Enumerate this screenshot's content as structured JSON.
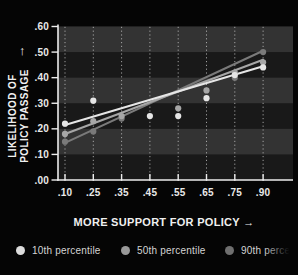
{
  "page": {
    "background": "#050505"
  },
  "chart_data": {
    "type": "scatter",
    "title": "",
    "xlabel": "MORE SUPPORT FOR POLICY →",
    "ylabel_line1": "LIKELIHOOD OF",
    "ylabel_line2": "POLICY PASSAGE",
    "ylabel_arrow": "↑",
    "x_tick_labels": [
      ".10",
      ".25",
      ".35",
      ".45",
      ".55",
      ".65",
      ".75",
      ".90"
    ],
    "x_tick_values": [
      0.1,
      0.25,
      0.35,
      0.45,
      0.55,
      0.65,
      0.75,
      0.9
    ],
    "x_axis_type": "ordinal-even-spacing",
    "y_tick_labels": [
      ".00",
      ".10",
      ".20",
      ".30",
      ".40",
      ".50",
      ".60"
    ],
    "y_tick_values": [
      0.0,
      0.1,
      0.2,
      0.3,
      0.4,
      0.5,
      0.6
    ],
    "ylim": [
      0.0,
      0.6
    ],
    "grid": "vertical dotted gridlines at each x tick",
    "background_bands": [
      [
        0.1,
        0.2
      ],
      [
        0.3,
        0.4
      ],
      [
        0.5,
        0.6
      ]
    ],
    "legend_position": "bottom",
    "series": [
      {
        "name": "10th percentile",
        "color": "#e6e6e6",
        "points": [
          [
            0.1,
            0.22
          ],
          [
            0.25,
            0.31
          ],
          [
            0.45,
            0.25
          ],
          [
            0.55,
            0.25
          ],
          [
            0.65,
            0.32
          ],
          [
            0.75,
            0.41
          ],
          [
            0.9,
            0.44
          ]
        ],
        "trend": {
          "x1": 0.1,
          "y1": 0.215,
          "x2": 0.9,
          "y2": 0.445
        }
      },
      {
        "name": "50th percentile",
        "color": "#a6a6a6",
        "points": [
          [
            0.1,
            0.18
          ],
          [
            0.25,
            0.23
          ],
          [
            0.35,
            0.25
          ],
          [
            0.55,
            0.28
          ],
          [
            0.65,
            0.35
          ],
          [
            0.75,
            0.42
          ],
          [
            0.9,
            0.46
          ]
        ],
        "trend": {
          "x1": 0.1,
          "y1": 0.18,
          "x2": 0.9,
          "y2": 0.47
        }
      },
      {
        "name": "90th percentile",
        "color": "#7a7a7a",
        "points": [
          [
            0.1,
            0.15
          ],
          [
            0.25,
            0.19
          ],
          [
            0.35,
            0.24
          ],
          [
            0.75,
            0.4
          ],
          [
            0.9,
            0.5
          ]
        ],
        "trend": {
          "x1": 0.1,
          "y1": 0.145,
          "x2": 0.9,
          "y2": 0.505
        }
      }
    ],
    "legend": [
      {
        "label": "10th percentile",
        "color": "#dcdcdc"
      },
      {
        "label": "50th percentile",
        "color": "#999999"
      },
      {
        "label": "90th percentile",
        "color": "#6f6f6f"
      }
    ]
  },
  "colors": {
    "band": "#333333",
    "plot_bg": "#191919",
    "axis": "#ececec",
    "gridline": "#cccccc",
    "tick_label": "#e9e9e9",
    "legend_text": "#d4d4d4"
  }
}
